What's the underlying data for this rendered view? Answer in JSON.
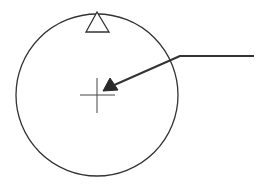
{
  "diagram": {
    "type": "patent-line-drawing",
    "colors": {
      "background": "#ffffff",
      "stroke": "#333333",
      "arrow_fill": "#2a2a2a"
    },
    "elements": {
      "circle": {
        "cx": 97,
        "cy": 95,
        "r": 81
      },
      "index_triangle": {
        "apex": [
          97,
          12
        ],
        "base_left": [
          86,
          32
        ],
        "base_right": [
          109,
          32
        ]
      },
      "crosshair": {
        "cx": 97,
        "cy": 95,
        "h_from": 80,
        "h_to": 115,
        "v_from": 78,
        "v_to": 113
      },
      "leader_line": {
        "points": [
          [
            254,
            56
          ],
          [
            180,
            56
          ],
          [
            110,
            87
          ]
        ],
        "arrow_tip": [
          103,
          91
        ]
      }
    },
    "labels": []
  }
}
